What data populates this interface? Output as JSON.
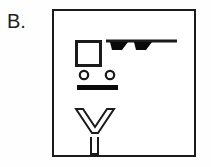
{
  "panel": {
    "label": "B."
  },
  "colors": {
    "ink": "#1b1b1b",
    "stroke": "#231f20",
    "fill": "#000000",
    "paper": "#ffffff",
    "page_background": "#fefefe"
  },
  "frame": {
    "name": "figure-frame",
    "x": 52,
    "y": 9,
    "width": 144,
    "height": 148,
    "border_width": 2.5,
    "border_color": "#1b1b1b",
    "fill": "#ffffff"
  },
  "diagram": {
    "title": "B.",
    "elements": [
      {
        "id": "hollow-square",
        "name": "hollow-square-symbol",
        "type": "square-outline",
        "x": 23,
        "y": 31,
        "width": 27,
        "height": 27,
        "stroke_width": 3,
        "stroke": "#1b1b1b",
        "fill": "none"
      },
      {
        "id": "wind-barb",
        "name": "wind-barb-symbol",
        "type": "line-with-barbs",
        "line": {
          "x1": 54,
          "y1": 32,
          "x2": 125,
          "y2": 32,
          "stroke_width": 3
        },
        "barbs": [
          {
            "index": 1,
            "top_x": 58,
            "bottom_x": 68,
            "length": 18,
            "slant": 10,
            "thickness": 6
          },
          {
            "index": 2,
            "top_x": 82,
            "bottom_x": 92,
            "length": 18,
            "slant": 10,
            "thickness": 6
          }
        ],
        "barb_count": 2,
        "fill": "#000000"
      },
      {
        "id": "circle-pair",
        "name": "circle-pair-symbol",
        "type": "two-rings",
        "circles": [
          {
            "index": 1,
            "cx": 32,
            "cy": 66,
            "r": 4.2,
            "stroke_width": 2.2
          },
          {
            "index": 2,
            "cx": 58,
            "cy": 66,
            "r": 4.2,
            "stroke_width": 2.2
          }
        ],
        "stroke": "#1b1b1b",
        "fill": "none"
      },
      {
        "id": "solid-bar",
        "name": "solid-bar-symbol",
        "type": "filled-rectangle",
        "x": 25,
        "y": 76,
        "width": 41,
        "height": 5,
        "fill": "#000000"
      },
      {
        "id": "chevron-v",
        "name": "chevron-outline-symbol",
        "type": "v-outline",
        "left_tip_x": 24,
        "right_tip_x": 61,
        "top_y": 100,
        "apex_x": 42,
        "apex_y": 124,
        "arm_thickness": 7,
        "stroke_width": 2,
        "stroke": "#1b1b1b",
        "fill": "none"
      },
      {
        "id": "stem-u",
        "name": "stem-outline-symbol",
        "type": "u-outline",
        "x": 38,
        "y": 128,
        "width": 8,
        "height": 18,
        "stroke_width": 2,
        "stroke": "#1b1b1b",
        "fill": "none"
      }
    ]
  }
}
